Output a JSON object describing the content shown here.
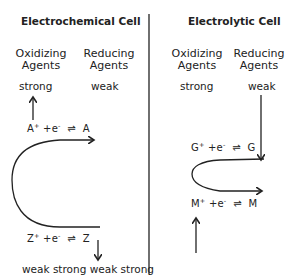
{
  "left_panel": {
    "title": "Electrochemical Cell",
    "col1_header": [
      "Oxidizing",
      "Agents"
    ],
    "col2_header": [
      "Reducing",
      "Agents"
    ],
    "col1_top": "strong",
    "col2_top": "weak",
    "eq_top": {
      "species_ox": "A",
      "charge": "+",
      "electron": "+e",
      "e_charge": "-",
      "arrow": "⇌",
      "species_red": "A"
    },
    "eq_bottom": {
      "species_ox": "Z",
      "charge": "+",
      "electron": "+e",
      "e_charge": "-",
      "arrow": "⇌",
      "species_red": "Z"
    },
    "bottom_labels": "weak strong weak strong"
  },
  "right_panel": {
    "title": "Electrolytic Cell",
    "col1_header": [
      "Oxidizing",
      "Agents"
    ],
    "col2_header": [
      "Reducing",
      "Agents"
    ],
    "col1_top": "strong",
    "col2_top": "weak",
    "eq_top": {
      "species_ox": "G",
      "charge": "+",
      "electron": "+e",
      "e_charge": "-",
      "arrow": "⇌",
      "species_red": "G"
    },
    "eq_bottom": {
      "species_ox": "M",
      "charge": "+",
      "electron": "+e",
      "e_charge": "-",
      "arrow": "⇌",
      "species_red": "M"
    }
  },
  "colors": {
    "ink": "#222222",
    "background": "#ffffff"
  }
}
